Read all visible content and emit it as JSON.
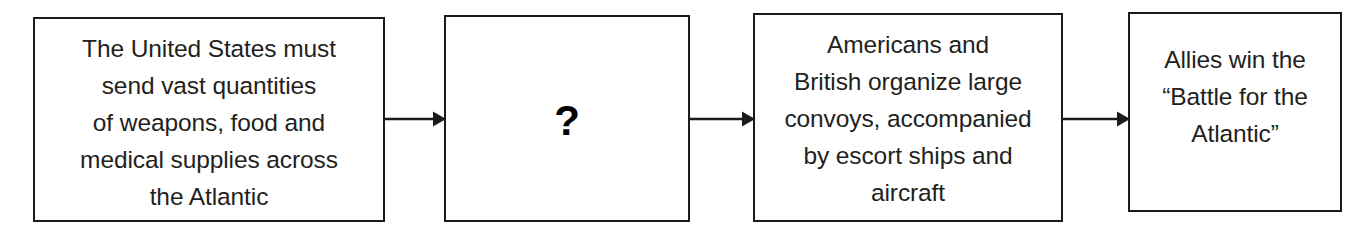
{
  "diagram": {
    "type": "flowchart",
    "orientation": "left-to-right",
    "title": "",
    "stroke_color": "#1b1b1b",
    "text_color": "#231f20",
    "background_color": "#ffffff",
    "nodes": [
      {
        "id": "node-1",
        "name": "premise-box",
        "text": "The United States must\nsend vast quantities\nof weapons, food and\nmedical supplies across\nthe Atlantic",
        "lines": [
          "The United States must",
          "send vast quantities",
          "of weapons, food and",
          "medical supplies across",
          "the Atlantic"
        ],
        "x": 33,
        "y": 17,
        "width": 352,
        "height": 205,
        "text_top": 11
      },
      {
        "id": "node-2",
        "name": "unknown-step-box",
        "text": "?",
        "lines": [
          "?"
        ],
        "x": 444,
        "y": 15,
        "width": 246,
        "height": 207,
        "text_top": 83
      },
      {
        "id": "node-3",
        "name": "convoy-box",
        "text": "Americans and\nBritish organize large\nconvoys, accompanied\nby escort ships and\naircraft",
        "lines": [
          "Americans and",
          "British organize large",
          "convoys, accompanied",
          "by escort ships and",
          "aircraft"
        ],
        "x": 753,
        "y": 13,
        "width": 310,
        "height": 209,
        "text_top": 11
      },
      {
        "id": "node-4",
        "name": "outcome-box",
        "text": "Allies win the\n“Battle for the\nAtlantic”",
        "lines": [
          "Allies win the",
          "“Battle for the",
          "Atlantic”"
        ],
        "x": 1128,
        "y": 12,
        "width": 214,
        "height": 200,
        "text_top": 27
      }
    ],
    "connectors": [
      {
        "id": "arrow-1",
        "name": "arrow-premise-to-unknown",
        "from": "node-1",
        "to": "node-2",
        "label": "",
        "x": 383,
        "y": 107,
        "width": 63
      },
      {
        "id": "arrow-2",
        "name": "arrow-unknown-to-convoy",
        "from": "node-2",
        "to": "node-3",
        "label": "",
        "x": 688,
        "y": 107,
        "width": 67
      },
      {
        "id": "arrow-3",
        "name": "arrow-convoy-to-outcome",
        "from": "node-3",
        "to": "node-4",
        "label": "",
        "x": 1061,
        "y": 107,
        "width": 69
      }
    ]
  }
}
